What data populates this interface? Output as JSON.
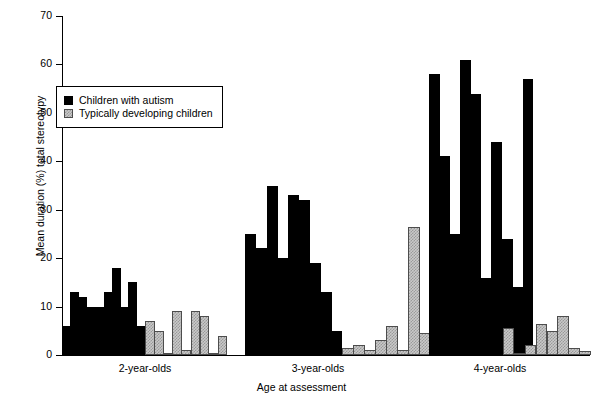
{
  "chart_data": {
    "type": "bar",
    "title": "",
    "xlabel": "Age at assessment",
    "ylabel": "Mean duration (%) total stereotypy",
    "ylim": [
      0,
      70
    ],
    "yticks": [
      0,
      10,
      20,
      30,
      40,
      50,
      60,
      70
    ],
    "ytick_labels": [
      "0",
      "10",
      "20",
      "30",
      "40",
      "50",
      "60",
      "70"
    ],
    "grid": false,
    "legend_position": "upper-left-inside",
    "categories": [
      "2-year-olds",
      "3-year-olds",
      "4-year-olds"
    ],
    "legend": [
      {
        "name": "Children with autism",
        "color": "#000000",
        "pattern": "solid"
      },
      {
        "name": "Typically developing children",
        "color": "#c9c9c9",
        "pattern": "checkered"
      }
    ],
    "groups": [
      {
        "label": "2-year-olds",
        "series": [
          {
            "name": "Children with autism",
            "values": [
              6,
              13,
              12,
              10,
              10,
              13,
              18,
              10,
              15,
              6
            ]
          },
          {
            "name": "Typically developing children",
            "values": [
              7,
              5,
              0.3,
              9,
              1,
              9,
              8,
              0,
              4
            ]
          }
        ]
      },
      {
        "label": "3-year-olds",
        "series": [
          {
            "name": "Children with autism",
            "values": [
              25,
              22,
              35,
              20,
              33,
              32,
              19,
              13,
              5
            ]
          },
          {
            "name": "Typically developing children",
            "values": [
              1.5,
              2,
              1,
              3,
              6,
              1,
              26.5,
              4.5
            ]
          }
        ]
      },
      {
        "label": "4-year-olds",
        "series": [
          {
            "name": "Children with autism",
            "values": [
              58,
              41,
              25,
              61,
              54,
              16,
              44,
              24,
              14,
              57
            ]
          },
          {
            "name": "Typically developing children",
            "values": [
              5.5,
              0.3,
              2,
              6.5,
              5,
              8,
              1.5,
              0.8
            ]
          }
        ]
      }
    ]
  },
  "axis": {
    "ylabel": "Mean duration (%) total stereotypy",
    "xlabel": "Age at assessment",
    "ticks": [
      "70",
      "60",
      "50",
      "40",
      "30",
      "20",
      "10",
      "0"
    ]
  },
  "legend": {
    "autism_label": "Children with autism",
    "typical_label": "Typically developing children"
  },
  "groups": {
    "g1_label": "2-year-olds",
    "g2_label": "3-year-olds",
    "g3_label": "4-year-olds"
  }
}
